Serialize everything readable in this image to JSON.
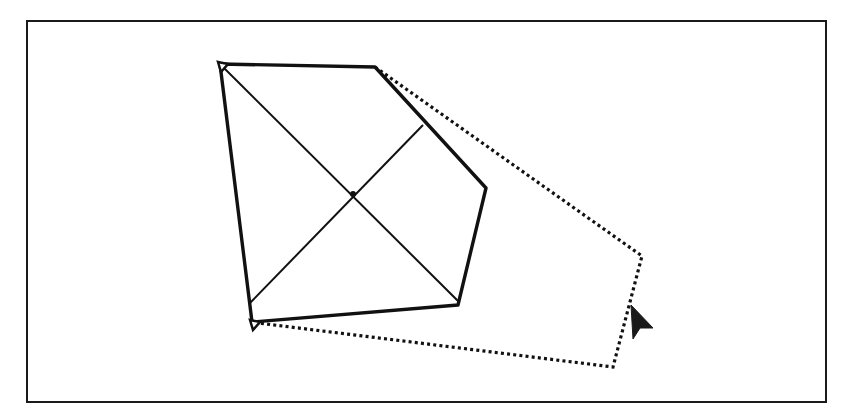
{
  "diagram": {
    "type": "shape-drag-preview",
    "colors": {
      "stroke": "#111111",
      "background": "#ffffff",
      "frame": "#1a1a1a",
      "cursor": "#1a1a1a"
    },
    "frame": {
      "x": 27,
      "y": 21,
      "width": 798,
      "height": 380
    },
    "solid_shape": {
      "label": "pentagon",
      "points": [
        [
          220,
          64
        ],
        [
          375,
          67
        ],
        [
          486,
          188
        ],
        [
          458,
          305
        ],
        [
          252,
          322
        ]
      ],
      "diagonals": [
        [
          [
            224,
            68
          ],
          [
            458,
            301
          ]
        ],
        [
          [
            250,
            303
          ],
          [
            423,
            125
          ]
        ]
      ],
      "center": [
        353,
        194
      ]
    },
    "dotted_shape": {
      "label": "drag-outline",
      "points": [
        [
          375,
          67
        ],
        [
          642,
          256
        ],
        [
          613,
          367
        ],
        [
          258,
          323
        ]
      ]
    },
    "cursor": {
      "icon": "arrow-pointer-icon",
      "tip": [
        631,
        305
      ]
    }
  }
}
